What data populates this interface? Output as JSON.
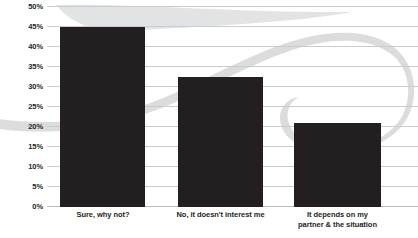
{
  "chart_data": {
    "type": "bar",
    "title": "",
    "subtitle": "",
    "xlabel": "",
    "ylabel": "",
    "ylim": [
      0,
      50
    ],
    "ytick_step": 5,
    "grid": true,
    "legend": "none",
    "y_tick_labels": [
      "0%",
      "5%",
      "10%",
      "15%",
      "20%",
      "25%",
      "30%",
      "35%",
      "40%",
      "45%",
      "50%"
    ],
    "y_tick_values": [
      0,
      5,
      10,
      15,
      20,
      25,
      30,
      35,
      40,
      45,
      50
    ],
    "categories": [
      "Sure, why not?",
      "No, it doesn't interest me",
      "It depends on my partner & the situation"
    ],
    "category_lines": [
      [
        "Sure, why not?"
      ],
      [
        "No, it doesn't interest me"
      ],
      [
        "It depends on my",
        "partner & the situation"
      ]
    ],
    "values": [
      45,
      32.5,
      21
    ],
    "value_labels": [
      "45%",
      "32.5%",
      "21%"
    ],
    "series": [
      {
        "name": "Share of respondents",
        "values": [
          45,
          32.5,
          21
        ]
      }
    ],
    "colors": {
      "bar": "#231f20",
      "gridline": "#c9cbcd",
      "axis": "#b9bbbd",
      "text": "#231f20",
      "background": "#ffffff",
      "swoosh": "#d3d5d7"
    },
    "annotations": [
      {
        "name": "decorative-swoosh-ribbon",
        "description": "light gray ribbon swoosh with open loop sweeping across the plot background"
      }
    ]
  }
}
